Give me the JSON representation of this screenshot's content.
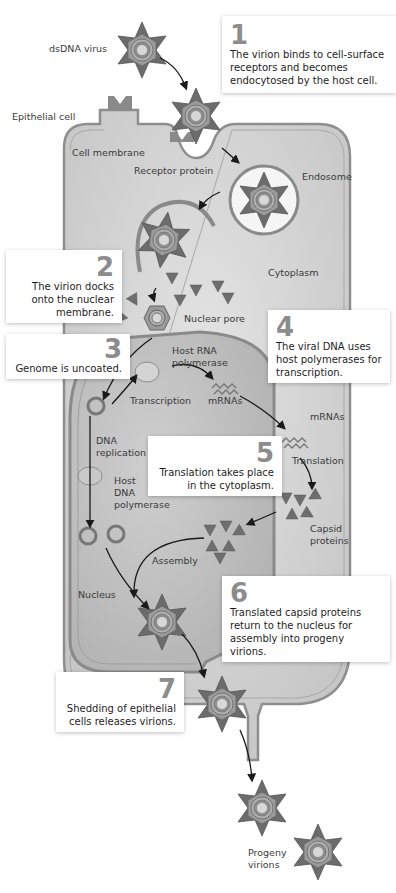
{
  "figure": {
    "title_partial": "Figure: Replication cycle of a dsDNA virus (epithelial cell)"
  },
  "labels": {
    "dsdna_virus": "dsDNA virus",
    "epithelial_cell": "Epithelial cell",
    "cell_membrane": "Cell membrane",
    "receptor_protein": "Receptor protein",
    "endosome": "Endosome",
    "cytoplasm": "Cytoplasm",
    "nuclear_pore": "Nuclear pore",
    "host_rna_polymerase": "Host RNA\npolymerase",
    "host_rna_polymerase_l1": "Host RNA",
    "host_rna_polymerase_l2": "polymerase",
    "transcription": "Transcription",
    "mrnas_1": "mRNAs",
    "mrnas_2": "mRNAs",
    "dna_replication_l1": "DNA",
    "dna_replication_l2": "replication",
    "host_dna_polymerase_l1": "Host",
    "host_dna_polymerase_l2": "DNA",
    "host_dna_polymerase_l3": "polymerase",
    "translation": "Translation",
    "capsid_proteins_l1": "Capsid",
    "capsid_proteins_l2": "proteins",
    "assembly": "Assembly",
    "nucleus": "Nucleus",
    "progeny_virions_l1": "Progeny",
    "progeny_virions_l2": "virions"
  },
  "steps": [
    {
      "number": "1",
      "text": "The virion binds to cell-surface receptors and becomes endocytosed by the host cell."
    },
    {
      "number": "2",
      "text": "The virion docks onto the nuclear membrane."
    },
    {
      "number": "3",
      "text": "Genome is uncoated."
    },
    {
      "number": "4",
      "text": "The viral DNA uses host polymerases for transcription."
    },
    {
      "number": "5",
      "text": "Translation takes place in the cytoplasm."
    },
    {
      "number": "6",
      "text": "Translated capsid proteins return to the nucleus for assembly into progeny virions."
    },
    {
      "number": "7",
      "text": "Shedding of epithelial cells releases virions."
    }
  ],
  "colors": {
    "cell_fill": "#d2d2d2",
    "cell_edge": "#9a9a9a",
    "nucleus_fill": "#bdbdbd",
    "capsid": "#707070",
    "capsid_light": "#9a9a9a",
    "callout_bg": "#ffffff",
    "step_number": "#8c8c8c"
  }
}
